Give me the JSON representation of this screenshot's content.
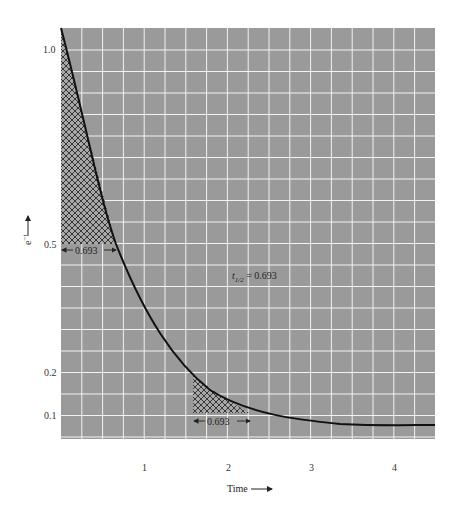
{
  "chart_data": {
    "type": "line",
    "title": "",
    "xlabel": "Time",
    "ylabel": "e^-t",
    "xlim": [
      0,
      4.5
    ],
    "ylim": [
      0,
      1.05
    ],
    "grid": true,
    "background_color": "#9a9a9a",
    "grid_color": "#ffffff",
    "curve_color": "#111111",
    "x_ticks": [
      "1",
      "2",
      "3",
      "4"
    ],
    "y_ticks": [
      "1.0",
      "0.5",
      "0.2",
      "0.1"
    ],
    "series": [
      {
        "name": "e^-t",
        "x": [
          0,
          0.25,
          0.5,
          0.693,
          1.0,
          1.5,
          2.0,
          2.5,
          3.0,
          3.5,
          4.0,
          4.5
        ],
        "values": [
          1.0,
          0.78,
          0.61,
          0.5,
          0.37,
          0.22,
          0.135,
          0.082,
          0.05,
          0.03,
          0.018,
          0.011
        ]
      }
    ],
    "annotations": [
      {
        "text": "0.693",
        "type": "interval",
        "x_from": 0,
        "x_to": 0.693,
        "y": 0.5,
        "hatched": true
      },
      {
        "text": "0.693",
        "type": "interval",
        "x_from": 1.6,
        "x_to": 2.293,
        "y": 0.1,
        "hatched": true
      },
      {
        "text": "t1/2 = 0.693",
        "x": 2.6,
        "y": 0.37
      }
    ]
  },
  "labels": {
    "x_axis": "Time",
    "y_axis_base": "e",
    "y_axis_exp": "−t",
    "half_life_t": "t",
    "half_life_sub": "1/2",
    "half_life_value": " = 0.693",
    "interval_1": "0.693",
    "interval_2": "0.693",
    "x_tick_1": "1",
    "x_tick_2": "2",
    "x_tick_3": "3",
    "x_tick_4": "4",
    "y_tick_10": "1.0",
    "y_tick_05": "0.5",
    "y_tick_02": "0.2",
    "y_tick_01": "0.1"
  }
}
